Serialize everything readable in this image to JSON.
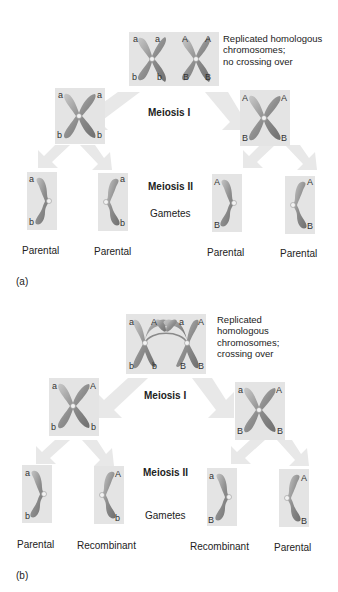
{
  "colors": {
    "box_background": "#e4e4e4",
    "arrow_fill": "#e6e6e6",
    "chromatid": "#9a9a9a",
    "chromatid_highlight": "#c8c8c8",
    "text": "#222222"
  },
  "panel_a": {
    "tag": "(a)",
    "description": "Replicated homologous\nchromosomes;\nno crossing over",
    "description_lines": [
      "Replicated homologous",
      "chromosomes;",
      "no crossing over"
    ],
    "meiosis_1": "Meiosis I",
    "meiosis_2": "Meiosis II",
    "gametes": "Gametes",
    "pair": {
      "left_chromosome": {
        "top": [
          "a",
          "a"
        ],
        "bottom": [
          "b",
          "b"
        ]
      },
      "right_chromosome": {
        "top": [
          "A",
          "A"
        ],
        "bottom": [
          "B",
          "B"
        ]
      }
    },
    "after_meiosis_1": [
      {
        "top": [
          "a",
          "a"
        ],
        "bottom": [
          "b",
          "b"
        ]
      },
      {
        "top": [
          "A",
          "A"
        ],
        "bottom": [
          "B",
          "B"
        ]
      }
    ],
    "gametes_list": [
      {
        "top": "a",
        "bottom": "b",
        "label": "Parental"
      },
      {
        "top": "a",
        "bottom": "b",
        "label": "Parental"
      },
      {
        "top": "A",
        "bottom": "B",
        "label": "Parental"
      },
      {
        "top": "A",
        "bottom": "B",
        "label": "Parental"
      }
    ]
  },
  "panel_b": {
    "tag": "(b)",
    "description_lines": [
      "Replicated",
      "homologous",
      "chromosomes;",
      "crossing over"
    ],
    "meiosis_1": "Meiosis I",
    "meiosis_2": "Meiosis II",
    "gametes": "Gametes",
    "pair": {
      "top_labels": [
        "a",
        "A",
        "a",
        "A"
      ],
      "bottom_labels": [
        "b",
        "b",
        "B",
        "B"
      ]
    },
    "after_meiosis_1": [
      {
        "top": [
          "a",
          "A"
        ],
        "bottom": [
          "b",
          "b"
        ]
      },
      {
        "top": [
          "a",
          "A"
        ],
        "bottom": [
          "B",
          "B"
        ]
      }
    ],
    "gametes_list": [
      {
        "top": "a",
        "bottom": "b",
        "label": "Parental"
      },
      {
        "top": "A",
        "bottom": "b",
        "label": "Recombinant"
      },
      {
        "top": "a",
        "bottom": "B",
        "label": "Recombinant"
      },
      {
        "top": "A",
        "bottom": "B",
        "label": "Parental"
      }
    ]
  }
}
